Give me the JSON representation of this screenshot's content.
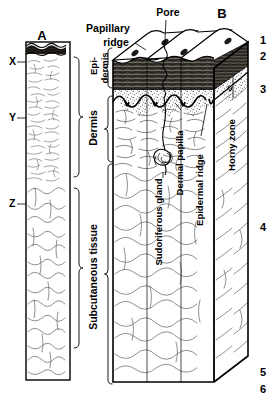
{
  "figure": {
    "panels": [
      {
        "id": "A",
        "label": "A"
      },
      {
        "id": "B",
        "label": "B"
      }
    ]
  },
  "panel_a": {
    "markers": [
      {
        "key": "x",
        "label": "X",
        "layer": "epidermis"
      },
      {
        "key": "y",
        "label": "Y",
        "layer": "dermis"
      },
      {
        "key": "z",
        "label": "Z",
        "layer": "subcutaneous tissue"
      }
    ]
  },
  "layer_braces": [
    {
      "key": "epidermis",
      "label_line1": "Epi-",
      "label_line2": "dermis"
    },
    {
      "key": "dermis",
      "label": "Dermis"
    },
    {
      "key": "subcutaneous",
      "label": "Subcutaneous tissue"
    }
  ],
  "callouts": {
    "papillary_ridge": {
      "label_line1": "Papillary",
      "label_line2": "ridge"
    },
    "pore": {
      "label": "Pore"
    },
    "sudoriferous_gland": {
      "label": "Sudoriferous gland"
    },
    "dermal_papilla": {
      "label": "Dermal papilla"
    },
    "epidermal_ridge": {
      "label": "Epidermal ridge"
    },
    "horny_zone": {
      "label": "Horny zone"
    }
  },
  "right_numbers": [
    {
      "label": "1"
    },
    {
      "label": "2"
    },
    {
      "label": "3"
    },
    {
      "label": "4"
    },
    {
      "label": "5"
    },
    {
      "label": "6"
    }
  ],
  "colors": {
    "ink": "#000000",
    "horny_band": "#3a3632",
    "stipple": "#ffffff",
    "paper": "#ffffff",
    "fiber": "#5a5a5a"
  }
}
